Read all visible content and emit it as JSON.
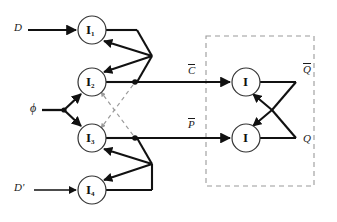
{
  "figure": {
    "kind": "logic-circuit-diagram",
    "background_color": "#ffffff",
    "line_color": "#111111",
    "dashed_color": "#9a9a9a",
    "canvas": {
      "width": 337,
      "height": 222
    }
  },
  "inputs": [
    {
      "id": "d",
      "label": "D",
      "x": 16,
      "y": 22,
      "wire_y": 30
    },
    {
      "id": "phi",
      "label": "ϕ",
      "x": 31,
      "y": 103,
      "wire_y": 110
    },
    {
      "id": "dbar",
      "label": "D'",
      "x": 16,
      "y": 182,
      "wire_y": 190
    }
  ],
  "gates": [
    {
      "id": "i1",
      "symbol": "I",
      "subscript": "1",
      "cx": 92,
      "cy": 30,
      "r": 14
    },
    {
      "id": "i2",
      "symbol": "I",
      "subscript": "2",
      "cx": 92,
      "cy": 82,
      "r": 14
    },
    {
      "id": "i3",
      "symbol": "I",
      "subscript": "3",
      "cx": 92,
      "cy": 138,
      "r": 14
    },
    {
      "id": "i4",
      "symbol": "I",
      "subscript": "4",
      "cx": 92,
      "cy": 190,
      "r": 14
    },
    {
      "id": "i5",
      "symbol": "I",
      "subscript": "",
      "cx": 246,
      "cy": 82,
      "r": 14
    },
    {
      "id": "i6",
      "symbol": "I",
      "subscript": "",
      "cx": 246,
      "cy": 138,
      "r": 14
    }
  ],
  "nets": [
    {
      "id": "cbar",
      "label": "C",
      "overbar": true,
      "x": 190,
      "y": 66
    },
    {
      "id": "pbar",
      "label": "P",
      "overbar": true,
      "x": 190,
      "y": 120
    }
  ],
  "outputs": [
    {
      "id": "qbar",
      "label": "Q",
      "overbar": true,
      "x": 305,
      "y": 64
    },
    {
      "id": "q",
      "label": "Q",
      "overbar": false,
      "x": 305,
      "y": 133
    }
  ],
  "boxes": [
    {
      "id": "latch-box",
      "style": "dashed",
      "x": 206,
      "y": 36,
      "width": 108,
      "height": 150
    }
  ],
  "junctions": [
    {
      "id": "phi-fanout",
      "x": 64,
      "y": 110
    },
    {
      "id": "i2-out-tap",
      "x": 135,
      "y": 82
    },
    {
      "id": "i3-out-tap",
      "x": 135,
      "y": 138
    }
  ],
  "dashed_feedback": [
    {
      "id": "i2-to-i3",
      "from": "i2-out-tap",
      "to": "i3-input"
    },
    {
      "id": "i3-to-i2",
      "from": "i3-out-tap",
      "to": "i2-input"
    }
  ]
}
